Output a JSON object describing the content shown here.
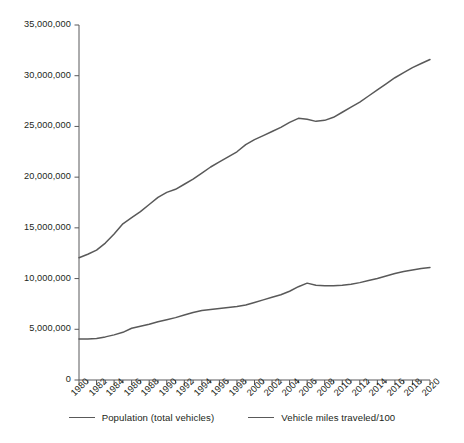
{
  "chart_data": {
    "type": "line",
    "title": "",
    "subtitle": "",
    "xlabel": "",
    "ylabel": "",
    "grid": false,
    "legend_position": "bottom",
    "xlim": [
      1980,
      2020
    ],
    "ylim": [
      0,
      35000000
    ],
    "y_ticks": [
      0,
      5000000,
      10000000,
      15000000,
      20000000,
      25000000,
      30000000,
      35000000
    ],
    "y_tick_labels": [
      "0",
      "5,000,000",
      "10,000,000",
      "15,000,000",
      "20,000,000",
      "25,000,000",
      "30,000,000",
      "35,000,000"
    ],
    "x_ticks": [
      1980,
      1982,
      1984,
      1986,
      1988,
      1990,
      1992,
      1994,
      1996,
      1998,
      2000,
      2002,
      2004,
      2006,
      2008,
      2010,
      2012,
      2014,
      2016,
      2018,
      2020
    ],
    "x_tick_labels": [
      "1980",
      "1982",
      "1984",
      "1986",
      "1988",
      "1990",
      "1992",
      "1994",
      "1996",
      "1998",
      "2000",
      "2002",
      "2004",
      "2006",
      "2008",
      "2010",
      "2012",
      "2014",
      "2016",
      "2018",
      "2020"
    ],
    "x_minor_ticks": [
      1981,
      1983,
      1985,
      1987,
      1989,
      1991,
      1993,
      1995,
      1997,
      1999,
      2001,
      2003,
      2005,
      2007,
      2009,
      2011,
      2013,
      2015,
      2017,
      2019
    ],
    "x": [
      1980,
      1981,
      1982,
      1983,
      1984,
      1985,
      1986,
      1987,
      1988,
      1989,
      1990,
      1991,
      1992,
      1993,
      1994,
      1995,
      1996,
      1997,
      1998,
      1999,
      2000,
      2001,
      2002,
      2003,
      2004,
      2005,
      2006,
      2007,
      2008,
      2009,
      2010,
      2011,
      2012,
      2013,
      2014,
      2015,
      2016,
      2017,
      2018,
      2019,
      2020
    ],
    "series": [
      {
        "name": "Population (total vehicles)",
        "color": "#595959",
        "values": [
          12050000,
          12400000,
          12800000,
          13500000,
          14400000,
          15400000,
          16000000,
          16600000,
          17300000,
          18000000,
          18500000,
          18800000,
          19300000,
          19800000,
          20400000,
          21000000,
          21500000,
          22000000,
          22500000,
          23200000,
          23700000,
          24100000,
          24500000,
          24900000,
          25400000,
          25800000,
          25700000,
          25500000,
          25600000,
          25900000,
          26400000,
          26900000,
          27400000,
          28000000,
          28600000,
          29200000,
          29800000,
          30300000,
          30800000,
          31200000,
          31600000
        ]
      },
      {
        "name": "Vehicle miles traveled/100",
        "color": "#595959",
        "values": [
          4050000,
          4050000,
          4100000,
          4250000,
          4450000,
          4700000,
          5100000,
          5300000,
          5500000,
          5750000,
          5950000,
          6150000,
          6400000,
          6650000,
          6850000,
          6950000,
          7050000,
          7150000,
          7250000,
          7400000,
          7650000,
          7900000,
          8150000,
          8400000,
          8750000,
          9200000,
          9550000,
          9350000,
          9300000,
          9300000,
          9350000,
          9450000,
          9600000,
          9800000,
          10000000,
          10250000,
          10500000,
          10700000,
          10850000,
          11000000,
          11100000
        ]
      }
    ],
    "legend": [
      "Population (total vehicles)",
      "Vehicle miles traveled/100"
    ]
  },
  "axes_geometry": {
    "left": 79,
    "right": 430,
    "top": 25,
    "bottom": 380
  }
}
